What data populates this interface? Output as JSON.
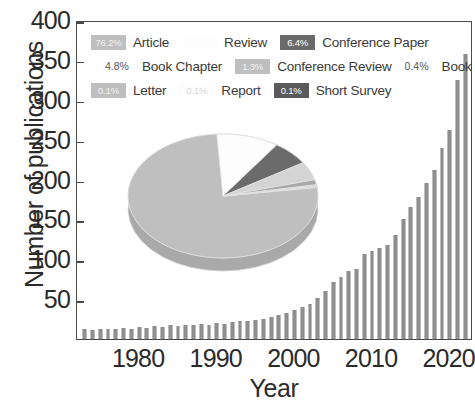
{
  "chart_data": {
    "type": "bar",
    "title": "",
    "xlabel": "Year",
    "ylabel": "Number of publications",
    "ylim": [
      0,
      400
    ],
    "yticks": [
      400,
      350,
      300,
      250,
      200,
      150,
      100,
      50
    ],
    "xticks": [
      1980,
      1990,
      2000,
      2010,
      2020
    ],
    "xlim": [
      1972,
      2023
    ],
    "grid": false,
    "legend_position": "top-left-inside",
    "bar_color": "#8e8e8e",
    "categories": [
      1973,
      1974,
      1975,
      1976,
      1977,
      1978,
      1979,
      1980,
      1981,
      1982,
      1983,
      1984,
      1985,
      1986,
      1987,
      1988,
      1989,
      1990,
      1991,
      1992,
      1993,
      1994,
      1995,
      1996,
      1997,
      1998,
      1999,
      2000,
      2001,
      2002,
      2003,
      2004,
      2005,
      2006,
      2007,
      2008,
      2009,
      2010,
      2011,
      2012,
      2013,
      2014,
      2015,
      2016,
      2017,
      2018,
      2019,
      2020,
      2021,
      2022
    ],
    "values": [
      12,
      11,
      12,
      13,
      12,
      14,
      13,
      15,
      14,
      16,
      15,
      17,
      16,
      18,
      17,
      19,
      18,
      20,
      19,
      21,
      22,
      23,
      24,
      25,
      28,
      30,
      32,
      36,
      40,
      44,
      52,
      60,
      72,
      78,
      85,
      88,
      106,
      110,
      114,
      118,
      130,
      150,
      165,
      178,
      196,
      212,
      240,
      262,
      325,
      358
    ]
  },
  "pie_data": {
    "type": "pie",
    "labels": [
      "Article",
      "Review",
      "Conference Paper",
      "Book Chapter",
      "Conference Review",
      "Book",
      "Letter",
      "Report",
      "Short Survey"
    ],
    "values": [
      76.2,
      10.6,
      6.4,
      4.8,
      1.3,
      0.4,
      0.1,
      0.1,
      0.1
    ],
    "colors": [
      "#bfbfbf",
      "#fdfdfd",
      "#6b6b6b",
      "#d4d4d4",
      "#a8a8a8",
      "#c9c9c9",
      "#bfbfbf",
      "#cfcfcf",
      "#5a5a5a"
    ]
  },
  "legend": {
    "rows": [
      [
        {
          "pct": "76.2%",
          "label": "Article",
          "style": "light"
        },
        {
          "pct": "",
          "label": "Review",
          "style": "white"
        },
        {
          "pct": "6.4%",
          "label": "Conference Paper",
          "style": "dark"
        }
      ],
      [
        {
          "pct": "4.8%",
          "label": "Book Chapter",
          "style": "plain"
        },
        {
          "pct": "1.3%",
          "label": "Conference Review",
          "style": "light"
        },
        {
          "pct": "0.4%",
          "label": "Book",
          "style": "plain"
        }
      ],
      [
        {
          "pct": "0.1%",
          "label": "Letter",
          "style": "light"
        },
        {
          "pct": "0.1%",
          "label": "Report",
          "style": "white"
        },
        {
          "pct": "0.1%",
          "label": "Short Survey",
          "style": "darker"
        }
      ]
    ]
  }
}
